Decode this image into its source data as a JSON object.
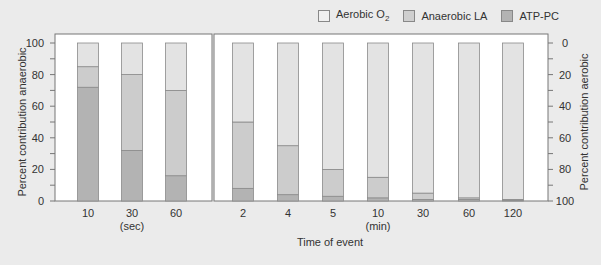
{
  "chart_data": {
    "type": "bar",
    "stacked": true,
    "title": "",
    "xlabel": "Time of event",
    "ylabel_left": "Percent contribution anaerobic",
    "ylabel_right": "Percent contribution aerobic",
    "ylim": [
      0,
      100
    ],
    "left_ticks": [
      "0",
      "20",
      "40",
      "60",
      "80",
      "100"
    ],
    "right_ticks": [
      "100",
      "80",
      "60",
      "40",
      "20",
      "0"
    ],
    "groups": [
      {
        "unit": "(sec)",
        "categories": [
          "10",
          "30",
          "60"
        ]
      },
      {
        "unit": "(min)",
        "categories": [
          "2",
          "4",
          "5",
          "10",
          "30",
          "60",
          "120"
        ]
      }
    ],
    "categories": [
      "10 s",
      "30 s",
      "60 s",
      "2 min",
      "4 min",
      "5 min",
      "10 min",
      "30 min",
      "60 min",
      "120 min"
    ],
    "series": [
      {
        "name": "ATP-PC",
        "color": "#b3b3b3",
        "values": [
          72,
          32,
          16,
          8,
          4,
          3,
          2,
          1,
          1,
          0.5
        ]
      },
      {
        "name": "Anaerobic LA",
        "color": "#cccccc",
        "values": [
          13,
          48,
          54,
          42,
          31,
          17,
          13,
          4,
          1,
          0.5
        ]
      },
      {
        "name": "Aerobic O2",
        "color": "#e3e3e3",
        "values": [
          15,
          20,
          30,
          50,
          65,
          80,
          85,
          95,
          98,
          99
        ]
      }
    ],
    "legend_position": "top-right",
    "grid": false
  },
  "legend": {
    "aerobic": "Aerobic O",
    "aerobic_sub": "2",
    "anaerobic": "Anaerobic LA",
    "atp": "ATP-PC"
  }
}
